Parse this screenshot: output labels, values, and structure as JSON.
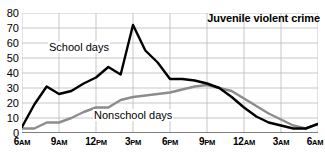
{
  "chart_data": {
    "type": "line",
    "title": "Juvenile violent crime",
    "xlabel": "",
    "ylabel": "",
    "ylim": [
      0,
      80
    ],
    "yticks": [
      0,
      10,
      20,
      30,
      40,
      50,
      60,
      70,
      80
    ],
    "grid": true,
    "legend_position": "inline-annotations",
    "x_tick_labels": [
      "6AM",
      "9AM",
      "12PM",
      "3PM",
      "6PM",
      "9PM",
      "12AM",
      "3AM",
      "6AM"
    ],
    "x_tick_hours": [
      6,
      9,
      12,
      15,
      18,
      21,
      24,
      27,
      30
    ],
    "x": [
      6,
      7,
      8,
      9,
      10,
      11,
      12,
      13,
      14,
      15,
      16,
      17,
      18,
      19,
      20,
      21,
      22,
      23,
      24,
      25,
      26,
      27,
      28,
      29,
      30
    ],
    "x_hour_labels": [
      "6AM",
      "7AM",
      "8AM",
      "9AM",
      "10AM",
      "11AM",
      "12PM",
      "1PM",
      "2PM",
      "3PM",
      "4PM",
      "5PM",
      "6PM",
      "7PM",
      "8PM",
      "9PM",
      "10PM",
      "11PM",
      "12AM",
      "1AM",
      "2AM",
      "3AM",
      "4AM",
      "5AM",
      "6AM"
    ],
    "series": [
      {
        "name": "School days",
        "color": "#000000",
        "values": [
          4,
          19,
          31,
          26,
          28,
          33,
          37,
          44,
          39,
          72,
          55,
          47,
          36,
          36,
          35,
          33,
          30,
          24,
          17,
          11,
          7,
          5,
          3,
          3,
          6
        ]
      },
      {
        "name": "Nonschool days",
        "color": "#8c8c8c",
        "values": [
          3,
          3,
          7,
          7,
          10,
          14,
          17,
          17,
          22,
          24,
          25,
          26,
          27,
          29,
          31,
          32,
          30,
          28,
          23,
          18,
          13,
          9,
          5,
          3,
          6
        ]
      }
    ],
    "annotations": [
      {
        "text": "Juvenile violent crime",
        "series": null,
        "style": "bold-title"
      },
      {
        "text": "School days",
        "series": "School days",
        "style": "inline"
      },
      {
        "text": "Nonschool days",
        "series": "Nonschool days",
        "style": "inline"
      }
    ]
  },
  "axis": {
    "y_tick_labels": [
      "80",
      "70",
      "60",
      "50",
      "40",
      "30",
      "20",
      "10",
      "0"
    ],
    "x_tick_labels": [
      {
        "num": "6",
        "mer": "AM"
      },
      {
        "num": "9",
        "mer": "AM"
      },
      {
        "num": "12",
        "mer": "PM"
      },
      {
        "num": "3",
        "mer": "PM"
      },
      {
        "num": "6",
        "mer": "PM"
      },
      {
        "num": "9",
        "mer": "PM"
      },
      {
        "num": "12",
        "mer": "AM"
      },
      {
        "num": "3",
        "mer": "AM"
      },
      {
        "num": "6",
        "mer": "AM"
      }
    ]
  },
  "colors": {
    "school_days_line": "#000000",
    "nonschool_days_line": "#8c8c8c",
    "gridline": "#b9b9b9",
    "axis": "#555555",
    "background": "#ffffff",
    "text": "#000000"
  },
  "labels": {
    "chart_title": "Juvenile violent crime",
    "school_days": "School days",
    "nonschool_days": "Nonschool days"
  }
}
